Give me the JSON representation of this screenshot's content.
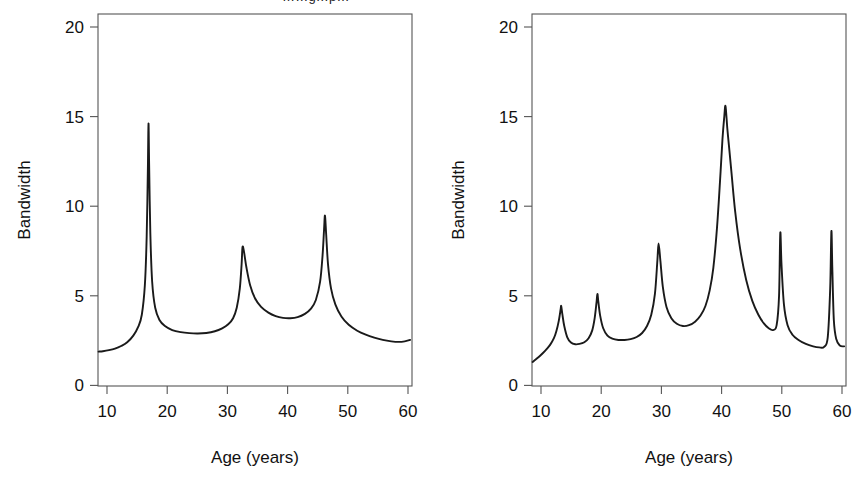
{
  "figure": {
    "background": "#ffffff",
    "line_color": "#1a1a1a",
    "axis_color": "#555555",
    "partial_top_text": "……g…p…"
  },
  "chart_data": [
    {
      "type": "line",
      "panel": "left",
      "title": "",
      "xlabel": "Age (years)",
      "ylabel": "Bandwidth",
      "xlim": [
        9.2,
        60.8
      ],
      "ylim": [
        -0.6,
        20.8
      ],
      "xticks": [
        10,
        20,
        30,
        40,
        50,
        60
      ],
      "xticklabels": [
        "10",
        "20",
        "30",
        "40",
        "50",
        "60"
      ],
      "yticks": [
        0,
        5,
        10,
        15,
        20
      ],
      "yticklabels": [
        "0",
        "5",
        "10",
        "15",
        "20"
      ],
      "grid": false,
      "legend": "none",
      "peaks": [
        {
          "x": 17.5,
          "y": 14.5
        },
        {
          "x": 32.9,
          "y": 7.4
        },
        {
          "x": 46.4,
          "y": 9.2
        }
      ],
      "x": [
        9.3,
        10.0,
        11.0,
        12.0,
        13.0,
        14.0,
        15.0,
        15.8,
        16.4,
        16.9,
        17.2,
        17.4,
        17.5,
        17.6,
        17.8,
        18.1,
        18.6,
        19.3,
        20.2,
        21.4,
        22.8,
        24.2,
        25.6,
        27.0,
        28.4,
        29.6,
        30.6,
        31.4,
        32.0,
        32.5,
        32.8,
        32.95,
        33.2,
        33.6,
        34.2,
        35.0,
        36.0,
        37.2,
        38.4,
        39.6,
        40.8,
        42.0,
        43.2,
        44.2,
        45.0,
        45.7,
        46.1,
        46.35,
        46.5,
        46.7,
        47.0,
        47.5,
        48.2,
        49.2,
        50.4,
        51.8,
        53.2,
        54.6,
        56.0,
        57.4,
        58.6,
        59.6,
        60.5
      ],
      "y": [
        1.38,
        1.4,
        1.46,
        1.55,
        1.7,
        1.92,
        2.3,
        2.8,
        3.5,
        5.2,
        8.0,
        12.0,
        14.5,
        12.2,
        8.2,
        5.4,
        3.9,
        3.2,
        2.85,
        2.62,
        2.5,
        2.44,
        2.42,
        2.45,
        2.55,
        2.72,
        2.95,
        3.3,
        3.9,
        5.0,
        6.4,
        7.4,
        7.1,
        6.2,
        5.2,
        4.45,
        3.95,
        3.62,
        3.42,
        3.32,
        3.3,
        3.36,
        3.55,
        3.85,
        4.35,
        5.4,
        6.9,
        8.4,
        9.2,
        8.1,
        6.4,
        5.0,
        4.1,
        3.4,
        2.92,
        2.58,
        2.35,
        2.18,
        2.05,
        1.97,
        1.94,
        1.97,
        2.05
      ]
    },
    {
      "type": "line",
      "panel": "right",
      "title": "",
      "xlabel": "Age (years)",
      "ylabel": "Bandwidth",
      "xlim": [
        9.2,
        60.8
      ],
      "ylim": [
        -0.6,
        20.8
      ],
      "xticks": [
        10,
        20,
        30,
        40,
        50,
        60
      ],
      "xticklabels": [
        "10",
        "20",
        "30",
        "40",
        "50",
        "60"
      ],
      "yticks": [
        0,
        5,
        10,
        15,
        20
      ],
      "yticklabels": [
        "0",
        "5",
        "10",
        "15",
        "20"
      ],
      "grid": false,
      "legend": "none",
      "peaks": [
        {
          "x": 14.0,
          "y": 4.0
        },
        {
          "x": 19.9,
          "y": 4.7
        },
        {
          "x": 30.0,
          "y": 7.6
        },
        {
          "x": 41.0,
          "y": 15.5
        },
        {
          "x": 50.0,
          "y": 8.2
        },
        {
          "x": 58.4,
          "y": 8.3
        }
      ],
      "x": [
        9.3,
        9.8,
        10.4,
        11.0,
        11.6,
        12.2,
        12.8,
        13.2,
        13.6,
        13.9,
        14.0,
        14.2,
        14.5,
        15.0,
        15.6,
        16.3,
        17.0,
        17.8,
        18.5,
        19.1,
        19.5,
        19.8,
        19.95,
        20.1,
        20.4,
        20.9,
        21.6,
        22.4,
        23.4,
        24.4,
        25.4,
        26.4,
        27.3,
        28.1,
        28.8,
        29.4,
        29.8,
        30.0,
        30.3,
        30.7,
        31.3,
        32.1,
        33.0,
        34.0,
        35.0,
        36.0,
        36.9,
        37.7,
        38.4,
        39.0,
        39.6,
        40.1,
        40.5,
        40.8,
        41.0,
        41.3,
        41.6,
        42.0,
        42.6,
        43.4,
        44.4,
        45.4,
        46.4,
        47.3,
        48.1,
        48.8,
        49.4,
        49.8,
        50.0,
        50.2,
        50.6,
        51.2,
        52.0,
        53.0,
        54.2,
        55.4,
        56.4,
        57.2,
        57.8,
        58.2,
        58.4,
        58.55,
        58.8,
        59.2,
        59.8,
        60.5
      ],
      "y": [
        0.78,
        0.92,
        1.1,
        1.3,
        1.52,
        1.78,
        2.15,
        2.55,
        3.15,
        3.8,
        4.0,
        3.5,
        2.85,
        2.2,
        1.9,
        1.8,
        1.82,
        1.92,
        2.15,
        2.6,
        3.3,
        4.2,
        4.7,
        4.25,
        3.45,
        2.72,
        2.3,
        2.12,
        2.05,
        2.05,
        2.1,
        2.22,
        2.45,
        2.85,
        3.5,
        4.7,
        6.6,
        7.6,
        6.6,
        5.1,
        3.95,
        3.3,
        2.98,
        2.85,
        2.9,
        3.1,
        3.45,
        4.0,
        4.9,
        6.2,
        8.5,
        11.2,
        13.6,
        14.9,
        15.5,
        14.2,
        13.1,
        11.6,
        9.4,
        7.3,
        5.5,
        4.3,
        3.5,
        3.0,
        2.72,
        2.62,
        2.9,
        4.6,
        8.2,
        6.4,
        4.1,
        2.9,
        2.35,
        2.05,
        1.82,
        1.68,
        1.62,
        1.65,
        2.2,
        5.0,
        8.3,
        6.2,
        3.2,
        2.1,
        1.72,
        1.68
      ]
    }
  ]
}
